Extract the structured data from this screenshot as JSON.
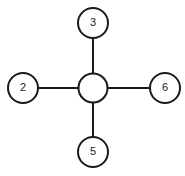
{
  "canvas": {
    "width": 185,
    "height": 176,
    "background_color": "#ffffff"
  },
  "diagram": {
    "type": "star-graph",
    "title": "",
    "stroke_color": "#1a1a1a",
    "node_fill_color": "#ffffff",
    "node_stroke_width": 2,
    "edge_stroke_width": 2,
    "nodes": [
      {
        "id": "center",
        "label": "",
        "cx": 93,
        "cy": 88,
        "r": 14.5,
        "role": "hub"
      },
      {
        "id": "top",
        "label": "3",
        "cx": 93,
        "cy": 23,
        "r": 15,
        "role": "leaf"
      },
      {
        "id": "left",
        "label": "2",
        "cx": 23,
        "cy": 88,
        "r": 15,
        "role": "leaf"
      },
      {
        "id": "right",
        "label": "6",
        "cx": 165,
        "cy": 88,
        "r": 15,
        "role": "leaf"
      },
      {
        "id": "bottom",
        "label": "5",
        "cx": 93,
        "cy": 152,
        "r": 15,
        "role": "leaf"
      }
    ],
    "edges": [
      {
        "id": "edge-center-top",
        "from": "center",
        "to": "top",
        "x1": 93,
        "y1": 88,
        "x2": 93,
        "y2": 23
      },
      {
        "id": "edge-center-left",
        "from": "center",
        "to": "left",
        "x1": 93,
        "y1": 88,
        "x2": 23,
        "y2": 88
      },
      {
        "id": "edge-center-right",
        "from": "center",
        "to": "right",
        "x1": 93,
        "y1": 88,
        "x2": 165,
        "y2": 88
      },
      {
        "id": "edge-center-bottom",
        "from": "center",
        "to": "bottom",
        "x1": 93,
        "y1": 88,
        "x2": 93,
        "y2": 152
      }
    ]
  }
}
